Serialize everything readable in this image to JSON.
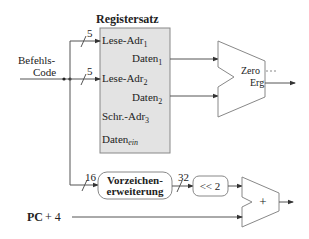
{
  "register_file": {
    "title": "Registersatz",
    "ports": {
      "read_addr1": "Lese-Adr",
      "read_addr1_sub": "1",
      "data1": "Daten",
      "data1_sub": "1",
      "read_addr2": "Lese-Adr",
      "read_addr2_sub": "2",
      "data2": "Daten",
      "data2_sub": "2",
      "write_addr": "Schr.-Adr",
      "write_addr_sub": "3",
      "data_in": "Daten",
      "data_in_sub": "ein"
    },
    "fill": "#e3e3e3"
  },
  "instruction": {
    "label1": "Befehls-",
    "label2": "Code"
  },
  "bus_widths": {
    "a1": "5",
    "a2": "5",
    "imm": "16",
    "ext": "32"
  },
  "alu": {
    "zero": "Zero",
    "result": "Erg",
    "zero_dots": "···"
  },
  "sign_ext": {
    "line1": "Vorzeichen-",
    "line2": "erweiterung"
  },
  "shift": {
    "label": "<< 2"
  },
  "adder": {
    "label": "+"
  },
  "pc": {
    "label": "PC",
    "plus": "+ 4"
  }
}
